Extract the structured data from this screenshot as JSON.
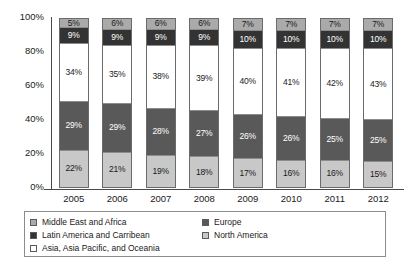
{
  "chart_data": {
    "type": "bar",
    "stacked": true,
    "normalized_percent": true,
    "title": "",
    "subtitle": "",
    "xlabel": "",
    "ylabel": "",
    "ylim": [
      0,
      100
    ],
    "grid": false,
    "legend_position": "bottom",
    "categories": [
      "2005",
      "2006",
      "2007",
      "2008",
      "2009",
      "2010",
      "2011",
      "2012"
    ],
    "y_ticks": [
      "0%",
      "20%",
      "40%",
      "60%",
      "80%",
      "100%"
    ],
    "y_tick_values": [
      0,
      20,
      40,
      60,
      80,
      100
    ],
    "stack_order_bottom_to_top": [
      "North America",
      "Europe",
      "Asia, Asia Pacific, and Oceania",
      "Latin America and Carribean",
      "Middle East and Africa"
    ],
    "series": [
      {
        "name": "North America",
        "color": "#c8c8c8",
        "label_color": "dark",
        "values": [
          22,
          21,
          19,
          18,
          17,
          16,
          16,
          15
        ],
        "labels": [
          "22%",
          "21%",
          "19%",
          "18%",
          "17%",
          "16%",
          "16%",
          "15%"
        ]
      },
      {
        "name": "Europe",
        "color": "#595959",
        "label_color": "light",
        "values": [
          29,
          29,
          28,
          27,
          26,
          26,
          25,
          25
        ],
        "labels": [
          "29%",
          "29%",
          "28%",
          "27%",
          "26%",
          "26%",
          "25%",
          "25%"
        ]
      },
      {
        "name": "Asia, Asia Pacific, and Oceania",
        "color": "#ffffff",
        "label_color": "dark",
        "values": [
          34,
          35,
          38,
          39,
          40,
          41,
          42,
          43
        ],
        "labels": [
          "34%",
          "35%",
          "38%",
          "39%",
          "40%",
          "41%",
          "42%",
          "43%"
        ]
      },
      {
        "name": "Latin America and Carribean",
        "color": "#333333",
        "label_color": "light",
        "values": [
          9,
          9,
          9,
          9,
          10,
          10,
          10,
          10
        ],
        "labels": [
          "9%",
          "9%",
          "9%",
          "9%",
          "10%",
          "10%",
          "10%",
          "10%"
        ]
      },
      {
        "name": "Middle East and Africa",
        "color": "#aaaaaa",
        "label_color": "dark",
        "values": [
          5,
          6,
          6,
          6,
          7,
          7,
          7,
          7
        ],
        "labels": [
          "5%",
          "6%",
          "6%",
          "6%",
          "7%",
          "7%",
          "7%",
          "7%"
        ]
      }
    ]
  },
  "legend": {
    "left_column": [
      {
        "label": "Middle East and Africa",
        "color": "#aaaaaa"
      },
      {
        "label": "Latin America and Carribean",
        "color": "#333333"
      },
      {
        "label": "Asia, Asia Pacific, and Oceania",
        "color": "#ffffff"
      }
    ],
    "right_column": [
      {
        "label": "Europe",
        "color": "#595959"
      },
      {
        "label": "North America",
        "color": "#c8c8c8"
      }
    ]
  }
}
